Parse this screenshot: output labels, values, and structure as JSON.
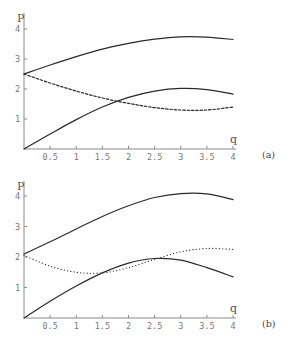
{
  "chart_data": [
    {
      "type": "line",
      "panel_label": "(a)",
      "xlabel": "q",
      "ylabel": "P",
      "xlim": [
        0,
        4
      ],
      "ylim": [
        0,
        4.4
      ],
      "x_ticks": [
        "0.5",
        "1",
        "1.5",
        "2",
        "2.5",
        "3",
        "3.5",
        "4"
      ],
      "y_ticks": [
        "1",
        "2",
        "3",
        "4"
      ],
      "grid": false,
      "legend": null,
      "series": [
        {
          "name": "upper-solid",
          "style": "solid",
          "x": [
            0,
            0.5,
            1,
            1.5,
            2,
            2.5,
            3,
            3.5,
            4
          ],
          "y": [
            2.5,
            2.8,
            3.08,
            3.33,
            3.52,
            3.66,
            3.74,
            3.73,
            3.65
          ]
        },
        {
          "name": "dashed",
          "style": "dashed",
          "x": [
            0,
            0.5,
            1,
            1.5,
            2,
            2.5,
            3,
            3.5,
            4
          ],
          "y": [
            2.5,
            2.2,
            1.93,
            1.7,
            1.52,
            1.38,
            1.3,
            1.3,
            1.4
          ]
        },
        {
          "name": "lower-solid",
          "style": "solid",
          "x": [
            0,
            0.5,
            1,
            1.5,
            2,
            2.5,
            3,
            3.5,
            4
          ],
          "y": [
            0,
            0.5,
            0.98,
            1.4,
            1.72,
            1.93,
            2.02,
            1.98,
            1.83
          ]
        }
      ]
    },
    {
      "type": "line",
      "panel_label": "(b)",
      "xlabel": "q",
      "ylabel": "P",
      "xlim": [
        0,
        4
      ],
      "ylim": [
        0,
        4.5
      ],
      "x_ticks": [
        "0.5",
        "1",
        "1.5",
        "2",
        "2.5",
        "3",
        "3.5",
        "4"
      ],
      "y_ticks": [
        "1",
        "2",
        "3",
        "4"
      ],
      "grid": false,
      "legend": null,
      "series": [
        {
          "name": "upper-solid",
          "style": "solid",
          "x": [
            0,
            0.5,
            1,
            1.5,
            2,
            2.5,
            3,
            3.5,
            4
          ],
          "y": [
            2.1,
            2.5,
            2.92,
            3.33,
            3.68,
            3.95,
            4.08,
            4.07,
            3.88
          ]
        },
        {
          "name": "dotted",
          "style": "dotted",
          "x": [
            0,
            0.5,
            1,
            1.5,
            2,
            2.5,
            3,
            3.5,
            4
          ],
          "y": [
            2.05,
            1.7,
            1.5,
            1.48,
            1.65,
            1.92,
            2.17,
            2.28,
            2.25
          ]
        },
        {
          "name": "lower-solid",
          "style": "solid",
          "x": [
            0,
            0.5,
            1,
            1.5,
            2,
            2.5,
            3,
            3.5,
            4
          ],
          "y": [
            0,
            0.55,
            1.05,
            1.48,
            1.8,
            1.95,
            1.9,
            1.65,
            1.35
          ]
        }
      ]
    }
  ],
  "layout": {
    "panels": [
      {
        "origin_x": 24,
        "origin_y": 149,
        "px_per_x": 52.25,
        "px_per_y": 30.0,
        "axis_top": 13,
        "axis_right": 236
      },
      {
        "origin_x": 24,
        "origin_y": 318,
        "px_per_x": 52.25,
        "px_per_y": 30.5,
        "axis_top": 181,
        "axis_right": 236
      }
    ],
    "colors": {
      "curve": "#2a2a2a",
      "axis": "#8a8a8a",
      "tick_label": "#7a7a7a"
    }
  }
}
